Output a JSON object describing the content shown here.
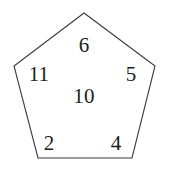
{
  "diagram": {
    "type": "pentagon-number-diagram",
    "shape": {
      "name": "pentagon",
      "sides": 5,
      "stroke_color": "#3a3a3a",
      "fill_color": "#ffffff",
      "vertices": [
        {
          "name": "apex",
          "x": 84,
          "y": 13
        },
        {
          "name": "right-upper",
          "x": 155,
          "y": 66
        },
        {
          "name": "right-lower",
          "x": 132,
          "y": 158
        },
        {
          "name": "left-lower",
          "x": 38,
          "y": 158
        },
        {
          "name": "left-upper",
          "x": 14,
          "y": 66
        }
      ]
    },
    "background_color": "#ffffff",
    "text_color": "#1c1c1c",
    "labels": {
      "top": "6",
      "left": "11",
      "right": "5",
      "center": "10",
      "bottom_left": "2",
      "bottom_right": "4"
    },
    "values": [
      6,
      11,
      5,
      10,
      2,
      4
    ]
  }
}
